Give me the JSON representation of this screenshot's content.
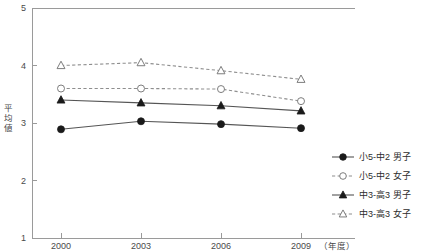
{
  "chart_data": {
    "type": "line",
    "title": "",
    "xlabel": "（年度）",
    "ylabel": "平均値",
    "categories": [
      "2000",
      "2003",
      "2006",
      "2009"
    ],
    "x": [
      2000,
      2003,
      2006,
      2009
    ],
    "ylim": [
      1,
      5
    ],
    "yticks": [
      "1",
      "2",
      "3",
      "4",
      "5"
    ],
    "ytick_values": [
      1,
      2,
      3,
      4,
      5
    ],
    "grid": false,
    "legend_position": "right",
    "series": [
      {
        "name": "小5-中2 男子",
        "values": [
          2.89,
          3.03,
          2.98,
          2.91
        ],
        "marker": "filled-circle",
        "line": "solid"
      },
      {
        "name": "小5-中2 女子",
        "values": [
          3.6,
          3.6,
          3.59,
          3.38
        ],
        "marker": "open-circle",
        "line": "dashed"
      },
      {
        "name": "中3-高3 男子",
        "values": [
          3.4,
          3.35,
          3.3,
          3.21
        ],
        "marker": "filled-triangle",
        "line": "solid"
      },
      {
        "name": "中3-高3 女子",
        "values": [
          4.0,
          4.05,
          3.91,
          3.76
        ],
        "marker": "open-triangle",
        "line": "dashed"
      }
    ]
  },
  "axis": {
    "y_label_chars": [
      "平",
      "均",
      "値"
    ],
    "y_ticks": [
      "5",
      "4",
      "3",
      "2",
      "1"
    ],
    "x_ticks": [
      "2000",
      "2003",
      "2006",
      "2009"
    ],
    "x_unit": "（年度）"
  },
  "legend": {
    "items": [
      {
        "label": "小5-中2 男子"
      },
      {
        "label": "小5-中2 女子"
      },
      {
        "label": "中3-高3 男子"
      },
      {
        "label": "中3-高3 女子"
      }
    ]
  },
  "colors": {
    "axis": "#9a9a9a",
    "solid_line": "#555555",
    "dashed_line": "#8e8e8e",
    "filled_marker": "#1a1a1a",
    "open_marker_stroke": "#7d7d7d",
    "background": "#ffffff",
    "text": "#3a3a3a"
  }
}
